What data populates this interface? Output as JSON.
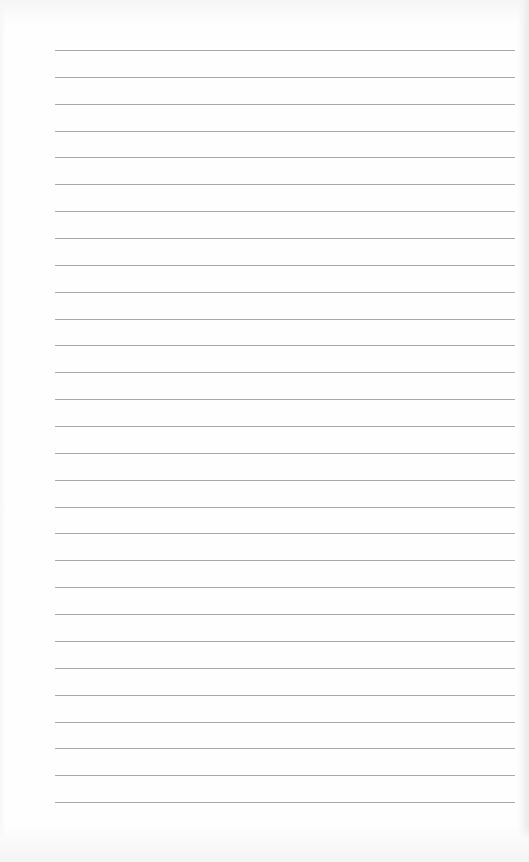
{
  "document": {
    "type": "lined-paper",
    "text_content": "",
    "colors": {
      "paper": "#fefefe",
      "rule": "#9a9a9a",
      "edge_shadow": "#e9e9e9"
    },
    "rules": {
      "count": 29,
      "first_y": 50,
      "spacing": 26.86,
      "x_start": 55,
      "x_end": 515
    }
  }
}
